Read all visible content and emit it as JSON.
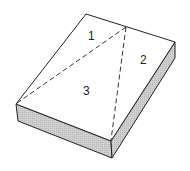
{
  "diagram": {
    "regions": [
      {
        "label": "1"
      },
      {
        "label": "2"
      },
      {
        "label": "3"
      }
    ],
    "colors": {
      "top_face": "#ffffff",
      "side_face": "#c8c8c8",
      "outline": "#222222"
    }
  }
}
